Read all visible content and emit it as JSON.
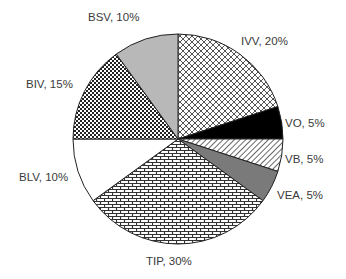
{
  "chart_data": {
    "type": "pie",
    "title": "",
    "start_angle_deg": 0,
    "direction": "clockwise",
    "categories": [
      "IVV",
      "VO",
      "VB",
      "VEA",
      "TIP",
      "BLV",
      "BIV",
      "BSV"
    ],
    "values": [
      20,
      5,
      5,
      5,
      30,
      10,
      15,
      10
    ],
    "labels": [
      "IVV, 20%",
      "VO, 5%",
      "VB, 5%",
      "VEA, 5%",
      "TIP, 30%",
      "BLV, 10%",
      "BIV, 15%",
      "BSV, 10%"
    ],
    "fills": [
      {
        "pattern": "diamond-lattice",
        "color": "#555555"
      },
      {
        "pattern": "solid",
        "color": "#000000"
      },
      {
        "pattern": "diagonal-stripes",
        "color": "#444444"
      },
      {
        "pattern": "solid",
        "color": "#7a7a7a"
      },
      {
        "pattern": "brick",
        "color": "#333333"
      },
      {
        "pattern": "solid",
        "color": "#ffffff"
      },
      {
        "pattern": "checker",
        "color": "#222222"
      },
      {
        "pattern": "solid",
        "color": "#b8b8b8"
      }
    ],
    "legend": "none (data labels outside slices)",
    "unit": "%"
  },
  "labels": {
    "ivv": "IVV, 20%",
    "vo": "VO, 5%",
    "vb": "VB, 5%",
    "vea": "VEA, 5%",
    "tip": "TIP, 30%",
    "blv": "BLV, 10%",
    "biv": "BIV, 15%",
    "bsv": "BSV, 10%"
  }
}
